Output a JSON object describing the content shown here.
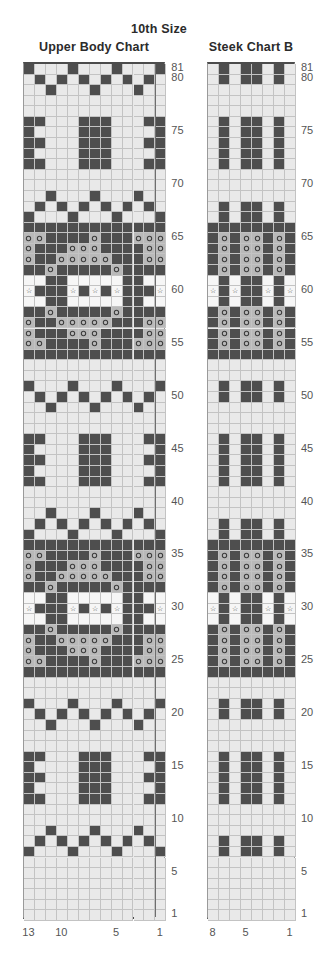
{
  "header": {
    "size_label": "10th Size"
  },
  "charts": [
    {
      "id": "upper-body",
      "title": "Upper Body Chart",
      "columns": 13,
      "rows": 81,
      "cell": 10.95,
      "row_height": 10.58,
      "col_labels": [
        {
          "col": 13,
          "text": "13"
        },
        {
          "col": 10,
          "text": "10"
        },
        {
          "col": 5,
          "text": "5"
        },
        {
          "col": 1,
          "text": "1"
        }
      ],
      "row_labels": [
        81,
        80,
        75,
        70,
        65,
        60,
        55,
        50,
        45,
        40,
        35,
        30,
        25,
        20,
        15,
        10,
        5,
        1
      ],
      "guide_columns": [
        12
      ],
      "pattern": [
        "DLLLDLLLDLLLD",
        "LDLDLDLDLDLDL",
        "LLDLLLDLLLDLL",
        "LLLLLLLLLLLLL",
        "LLLLLLLLLLLLL",
        "DDLLLDDDLLLDD",
        "DLLLLDDDLLLLD",
        "DDLLLDDDLLLDD",
        "DLLLLDDDLLLLD",
        "DDLLLDDDLLLDD",
        "LLLLLLLLLLLLL",
        "LLLLLLLLLLLLL",
        "LLDLLLDLLLDLL",
        "LDLDLDLDLDLDL",
        "DLLLDLLLDLLLD",
        "DDDDDDDDDDDDD",
        "OOddddOddd0OO",
        "OdddOOOdddd0O",
        "OddOOOOOddd0O",
        "ddOddddd0dddd",
        "WWddWWWWWddWW",
        "SdddSdSdSddd5",
        "WWddWWWWWddWW",
        "ddOddddd0dddd",
        "OddOOOOOddd0O",
        "OdddOOOdddd0O",
        "OOddddOddd0OO",
        "DDDDDDDDDDDDD",
        "LLLLLLLLLLLLL",
        "LLLLLLLLLLLLL",
        "DLLLDLLLDLLLD",
        "LDLDLDLDLDLDL",
        "LLDLLLDLLLDLL",
        "LLLLLLLLLLLLL",
        "LLLLLLLLLLLLL",
        "DDLLLDDDLLLDD",
        "DLLLLDDDLLLLD",
        "DDLLLDDDLLLDD",
        "DLLLLDDDLLLLD",
        "DDLLLDDDLLLDD",
        "LLLLLLLLLLLLL",
        "LLLLLLLLLLLLL",
        "LLDLLLDLLLDLL",
        "LDLDLDLDLDLDL",
        "DLLLDLLLDLLLD",
        "DDDDDDDDDDDDD",
        "OOddddOddd0OO",
        "OdddOOOdddd0O",
        "OddOOOOOddd0O",
        "ddOddddd0dddd",
        "WWddWWWWWddWW",
        "SdddSdSdSddd5",
        "WWddWWWWWddWW",
        "ddOddddd0dddd",
        "OddOOOOOddd0O",
        "OdddOOOdddd0O",
        "OOddddOddd0OO",
        "DDDDDDDDDDDDD",
        "LLLLLLLLLLLLL",
        "LLLLLLLLLLLLL",
        "DLLLDLLLDLLLD",
        "LDLDLDLDLDLDL",
        "LLDLLLDLLLDLL",
        "LLLLLLLLLLLLL",
        "LLLLLLLLLLLLL",
        "DDLLLDDDLLLDD",
        "DLLLLDDDLLLLD",
        "DDLLLDDDLLLDD",
        "DLLLLDDDLLLLD",
        "DDLLLDDDLLLDD",
        "LLLLLLLLLLLLL",
        "LLLLLLLLLLLLL",
        "LLDLLLDLLLDLL",
        "LDLDLDLDLDLDL",
        "DLLLDLLLDLLLD",
        "LLLLLLLLLLLLL",
        "LLLLLLLLLLLLL",
        "LLLLLLLLLLLLL",
        "LLLLLLLLLLLLL",
        "LLLLLLLLLLLLL",
        "LLLLLLLLLLLLL"
      ]
    },
    {
      "id": "steek-b",
      "title": "Steek Chart B",
      "columns": 8,
      "rows": 81,
      "cell": 11.0,
      "row_height": 10.58,
      "col_labels": [
        {
          "col": 8,
          "text": "8"
        },
        {
          "col": 5,
          "text": "5"
        },
        {
          "col": 1,
          "text": "1"
        }
      ],
      "row_labels": [
        81,
        80,
        75,
        70,
        65,
        60,
        55,
        50,
        45,
        40,
        35,
        30,
        25,
        20,
        15,
        10,
        5,
        1
      ],
      "guide_columns": [],
      "pattern": [
        "LDLDDLDL",
        "LDLDDLDL",
        "LLLLLLLL",
        "LLLLLLLL",
        "LLLLLLLL",
        "LDLDDLDL",
        "LDLDDLDL",
        "LDLDDLDL",
        "LDLDDLDL",
        "LDLDDLDL",
        "LLLLLLLL",
        "LLLLLLLL",
        "LLLLLLLL",
        "LDLDDLDL",
        "LDLDDLDL",
        "DDDDDDDD",
        "dOdOOdOd",
        "dOdOOdOd",
        "dOdOOdOd",
        "dOdOOdOd",
        "WdWddWdW",
        "SdSddSdS",
        "WdWddWdW",
        "dOdOOdOd",
        "dOdOOdOd",
        "dOdOOdOd",
        "dOdOOdOd",
        "DDDDDDDD",
        "LLLLLLLL",
        "LLLLLLLL",
        "LDLDDLDL",
        "LDLDDLDL",
        "LLLLLLLL",
        "LLLLLLLL",
        "LLLLLLLL",
        "LDLDDLDL",
        "LDLDDLDL",
        "LDLDDLDL",
        "LDLDDLDL",
        "LDLDDLDL",
        "LLLLLLLL",
        "LLLLLLLL",
        "LLLLLLLL",
        "LDLDDLDL",
        "LDLDDLDL",
        "DDDDDDDD",
        "dOdOOdOd",
        "dOdOOdOd",
        "dOdOOdOd",
        "dOdOOdOd",
        "WdWddWdW",
        "SdSddSdS",
        "WdWddWdW",
        "dOdOOdOd",
        "dOdOOdOd",
        "dOdOOdOd",
        "dOdOOdOd",
        "DDDDDDDD",
        "LLLLLLLL",
        "LLLLLLLL",
        "LDLDDLDL",
        "LDLDDLDL",
        "LLLLLLLL",
        "LLLLLLLL",
        "LLLLLLLL",
        "LDLDDLDL",
        "LDLDDLDL",
        "LDLDDLDL",
        "LDLDDLDL",
        "LDLDDLDL",
        "LLLLLLLL",
        "LLLLLLLL",
        "LLLLLLLL",
        "LDLDDLDL",
        "LDLDDLDL",
        "LLLLLLLL",
        "LLLLLLLL",
        "LLLLLLLL",
        "LLLLLLLL",
        "LLLLLLLL",
        "LLLLLLLL"
      ]
    }
  ],
  "legend": {
    "codes": {
      "L": "light-stitch",
      "D": "dark-stitch",
      "W": "white-stitch",
      "O": "circle-symbol-on-light",
      "o": "circle-symbol-on-dark",
      "S": "star-symbol-on-white"
    }
  },
  "colors": {
    "light": "#e9e9e9",
    "dark": "#4e4e4e",
    "white": "#f6f6f6",
    "grid_line": "#c3c3c3",
    "border": "#9a9a9a",
    "heavy_border": "#4c4c4c",
    "label_text": "#555555",
    "title_text": "#2b2b2b"
  }
}
